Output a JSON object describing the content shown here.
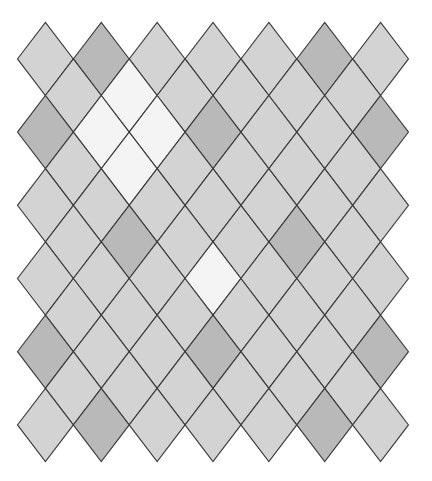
{
  "diagram": {
    "type": "diamond-tiling",
    "background": "#ffffff",
    "stroke_color": "#3a3a3a",
    "geometry": {
      "origin_x": 45.4,
      "origin_y": 58.9,
      "col_step": 55.86,
      "row_step": 36.6,
      "half_width": 27.93,
      "half_height": 36.6
    },
    "palette": {
      "L": "#d3d3d3",
      "D": "#b9b9b9",
      "W": "#f4f4f4"
    },
    "palette_names": {
      "L": "light-gray",
      "D": "dark-gray",
      "W": "white"
    },
    "rows": [
      {
        "row": 0,
        "offset": false,
        "cells": [
          "L",
          "D",
          "L",
          "L",
          "L",
          "D",
          "L"
        ]
      },
      {
        "row": 1,
        "offset": true,
        "cells": [
          "L",
          "W",
          "L",
          "L",
          "L",
          "L"
        ]
      },
      {
        "row": 2,
        "offset": false,
        "cells": [
          "D",
          "W",
          "W",
          "D",
          "L",
          "L",
          "D"
        ]
      },
      {
        "row": 3,
        "offset": true,
        "cells": [
          "L",
          "W",
          "L",
          "L",
          "L",
          "L"
        ]
      },
      {
        "row": 4,
        "offset": false,
        "cells": [
          "L",
          "L",
          "L",
          "L",
          "L",
          "L",
          "L"
        ]
      },
      {
        "row": 5,
        "offset": true,
        "cells": [
          "L",
          "D",
          "L",
          "L",
          "D",
          "L"
        ]
      },
      {
        "row": 6,
        "offset": false,
        "cells": [
          "L",
          "L",
          "L",
          "W",
          "L",
          "L",
          "L"
        ]
      },
      {
        "row": 7,
        "offset": true,
        "cells": [
          "L",
          "L",
          "L",
          "L",
          "L",
          "L"
        ]
      },
      {
        "row": 8,
        "offset": false,
        "cells": [
          "D",
          "L",
          "L",
          "D",
          "L",
          "L",
          "D"
        ]
      },
      {
        "row": 9,
        "offset": true,
        "cells": [
          "L",
          "L",
          "L",
          "L",
          "L",
          "L"
        ]
      },
      {
        "row": 10,
        "offset": false,
        "cells": [
          "L",
          "D",
          "L",
          "L",
          "L",
          "D",
          "L"
        ]
      }
    ]
  }
}
